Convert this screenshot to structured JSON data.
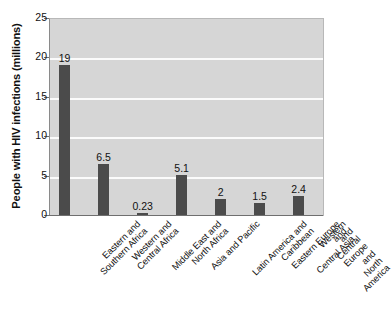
{
  "chart_data": {
    "type": "bar",
    "title": "",
    "subtitle": "",
    "xlabel": "",
    "ylabel": "People with HIV infections (millions)",
    "ylim": [
      0,
      25
    ],
    "yticks": [
      0,
      5,
      10,
      15,
      20,
      25
    ],
    "ytick_labels": [
      "0",
      "5",
      "10",
      "15",
      "20",
      "25"
    ],
    "grid": "horizontal",
    "legend": "none",
    "categories": [
      "Eastern and\nSouthern Africa",
      "Western and\nCentral Africa",
      "Middle East and\nNorth Africa",
      "Asia and Pacific",
      "Latin America and\nCaribbean",
      "Eastern Europe and\nCentral Asia",
      "Western and Central Europe\nand North America"
    ],
    "values": [
      19,
      6.5,
      0.23,
      5.1,
      2,
      1.5,
      2.4
    ],
    "value_labels": [
      "19",
      "6.5",
      "0.23",
      "5.1",
      "2",
      "1.5",
      "2.4"
    ],
    "colors": {
      "bar": "#4b4b4b",
      "plot_background": "#d6d6d6",
      "figure_background": "#ffffff",
      "gridline": "#fbfbfb",
      "axis": "#6f6f6f",
      "text": "#111111"
    }
  }
}
